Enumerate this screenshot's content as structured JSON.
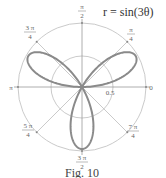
{
  "chart_data": {
    "type": "line",
    "coordinate_system": "polar",
    "title": "r = sin(3θ)",
    "caption": "Fig. 10",
    "equation": "r = sin(3θ)",
    "series": [
      {
        "name": "r = sin(3θ)",
        "kind": "rose curve (3 petals)",
        "theta_range": [
          0,
          3.14159
        ],
        "petal_directions": [
          "π/6",
          "5π/6",
          "3π/2"
        ],
        "max_r": 1,
        "color": "#888888"
      }
    ],
    "radial_grid": {
      "circles": [
        0.5,
        1
      ],
      "tick_labels": [
        {
          "r": 0.5,
          "label": "0.5"
        }
      ]
    },
    "angular_grid": {
      "angles": [
        "0",
        "π/4",
        "π/2",
        "3π/4",
        "π",
        "5π/4",
        "3π/2",
        "7π/4"
      ],
      "labels": [
        {
          "angle": 0,
          "num": "0",
          "den": ""
        },
        {
          "angle": 45,
          "num": "π",
          "den": "4"
        },
        {
          "angle": 90,
          "num": "π",
          "den": "2"
        },
        {
          "angle": 135,
          "num": "3 π",
          "den": "4"
        },
        {
          "angle": 180,
          "num": "π",
          "den": ""
        },
        {
          "angle": 225,
          "num": "5 π",
          "den": "4"
        },
        {
          "angle": 270,
          "num": "3 π",
          "den": "2"
        },
        {
          "angle": 315,
          "num": "7 π",
          "den": "4"
        }
      ]
    },
    "rlim": [
      0,
      1
    ],
    "grid": true,
    "legend": "none"
  },
  "style": {
    "curve_color": "#8a8a8a",
    "grid_color": "#bdbdbd",
    "axis_color": "#9a9a9a"
  },
  "labels": {
    "equation": "r = sin(3θ)",
    "caption": "Fig. 10",
    "radial_tick": "0.5",
    "zero": "0",
    "pi": "π",
    "pi_over_4_num": "π",
    "pi_over_4_den": "4",
    "pi_over_2_num": "π",
    "pi_over_2_den": "2",
    "three_pi_over_4_num": "3 π",
    "three_pi_over_4_den": "4",
    "five_pi_over_4_num": "5 π",
    "five_pi_over_4_den": "4",
    "three_pi_over_2_num": "3 π",
    "three_pi_over_2_den": "2",
    "seven_pi_over_4_num": "7 π",
    "seven_pi_over_4_den": "4"
  }
}
